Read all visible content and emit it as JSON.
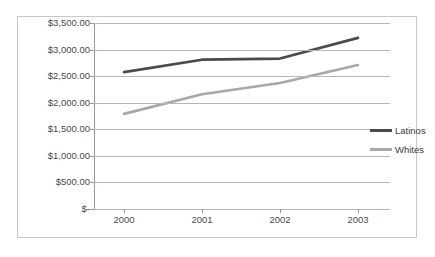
{
  "chart_data": {
    "type": "line",
    "title": "",
    "xlabel": "",
    "ylabel": "",
    "categories": [
      "2000",
      "2001",
      "2002",
      "2003"
    ],
    "series": [
      {
        "name": "Latinos",
        "color": "#4a4a4a",
        "values": [
          2575,
          2810,
          2830,
          3220
        ]
      },
      {
        "name": "Whites",
        "color": "#a8a8a8",
        "values": [
          1790,
          2160,
          2370,
          2710
        ]
      }
    ],
    "ylim": [
      0,
      3500
    ],
    "ytick_values": [
      0,
      500,
      1000,
      1500,
      2000,
      2500,
      3000,
      3500
    ],
    "ytick_labels": [
      "$-",
      "$500.00",
      "$1,000.00",
      "$1,500.00",
      "$2,000.00",
      "$2,500.00",
      "$3,000.00",
      "$3,500.00"
    ],
    "grid": true,
    "legend_position": "right",
    "legend_entries": [
      "Latinos",
      "Whites"
    ]
  },
  "colors": {
    "latinos": "#4a4a4a",
    "whites": "#a8a8a8",
    "gridline": "#b7b7b7",
    "axis": "#9a9a9a",
    "frame_border": "#c9c9c9",
    "tick_text": "#4a4a4a"
  }
}
